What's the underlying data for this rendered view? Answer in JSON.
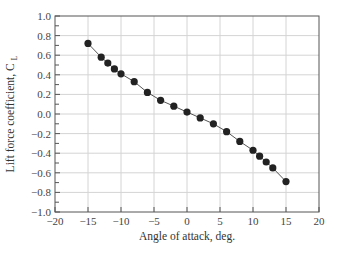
{
  "chart_data": {
    "type": "line",
    "title": "",
    "xlabel": "Angle of attack, deg.",
    "ylabel": "Lift force coefficient, C",
    "ylabel_subscript": "L",
    "xlim": [
      -20,
      20
    ],
    "ylim": [
      -1.0,
      1.0
    ],
    "x_ticks": [
      -20,
      -15,
      -10,
      -5,
      0,
      5,
      10,
      15,
      20
    ],
    "x_tick_labels": [
      "−20",
      "−15",
      "−10",
      "−5",
      "0",
      "5",
      "10",
      "15",
      "20"
    ],
    "y_ticks": [
      -1.0,
      -0.8,
      -0.6,
      -0.4,
      -0.2,
      0.0,
      0.2,
      0.4,
      0.6,
      0.8,
      1.0
    ],
    "y_tick_labels": [
      "−1.0",
      "−0.8",
      "−0.6",
      "−0.4",
      "−0.2",
      "0.0",
      "0.2",
      "0.4",
      "0.6",
      "0.8",
      "1.0"
    ],
    "grid": true,
    "legend": null,
    "series": [
      {
        "name": "Lift force coefficient",
        "marker": "filled-circle",
        "color": "#222222",
        "x": [
          -15,
          -13,
          -12,
          -11,
          -10,
          -8,
          -6,
          -4,
          -2,
          0,
          2,
          4,
          6,
          8,
          10,
          11,
          12,
          13,
          15
        ],
        "y": [
          0.72,
          0.58,
          0.52,
          0.46,
          0.41,
          0.33,
          0.22,
          0.14,
          0.08,
          0.02,
          -0.04,
          -0.1,
          -0.18,
          -0.28,
          -0.37,
          -0.43,
          -0.49,
          -0.55,
          -0.69
        ]
      }
    ]
  }
}
